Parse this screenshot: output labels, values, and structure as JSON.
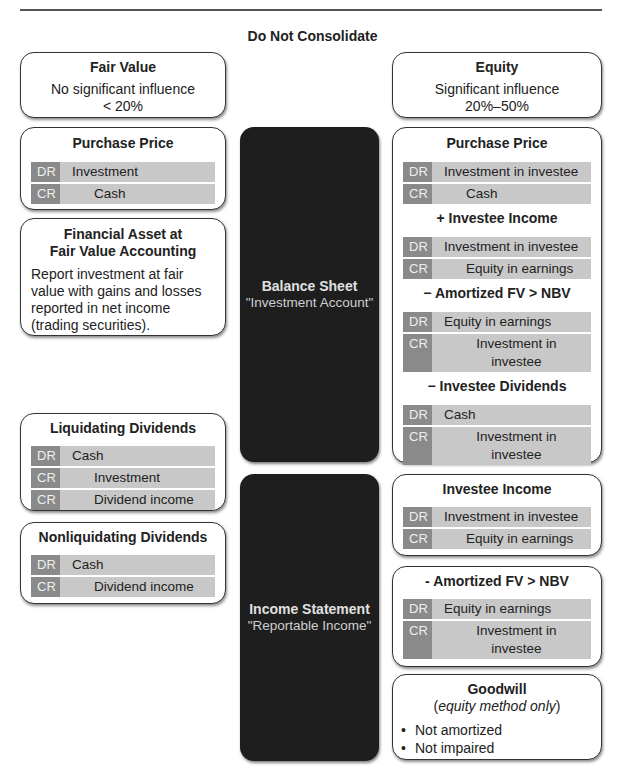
{
  "title": "Do Not Consolidate",
  "fair_value": {
    "header": {
      "title": "Fair Value",
      "line1": "No significant influence",
      "line2": "< 20%"
    },
    "purchase_price": {
      "title": "Purchase Price",
      "entries": [
        {
          "tag": "DR",
          "account": "Investment"
        },
        {
          "tag": "CR",
          "account": "Cash"
        }
      ]
    },
    "financial_asset": {
      "title_line1": "Financial Asset at",
      "title_line2": "Fair Value Accounting",
      "text": "Report investment at fair value with gains and losses reported in net income (trading securities)."
    },
    "liquidating": {
      "title": "Liquidating Dividends",
      "entries": [
        {
          "tag": "DR",
          "account": "Cash"
        },
        {
          "tag": "CR",
          "account": "Investment"
        },
        {
          "tag": "CR",
          "account": "Dividend income"
        }
      ]
    },
    "nonliquidating": {
      "title": "Nonliquidating Dividends",
      "entries": [
        {
          "tag": "DR",
          "account": "Cash"
        },
        {
          "tag": "CR",
          "account": "Dividend income"
        }
      ]
    }
  },
  "center": {
    "balance_sheet": {
      "title": "Balance Sheet",
      "subtitle": "\"Investment Account\""
    },
    "income_statement": {
      "title": "Income Statement",
      "subtitle": "\"Reportable Income\""
    }
  },
  "equity": {
    "header": {
      "title": "Equity",
      "line1": "Significant influence",
      "line2": "20%–50%"
    },
    "balance_sheet_box": {
      "purchase_price": {
        "title": "Purchase Price",
        "entries": [
          {
            "tag": "DR",
            "account": "Investment in investee"
          },
          {
            "tag": "CR",
            "account": "Cash"
          }
        ]
      },
      "investee_income": {
        "title": "+ Investee Income",
        "entries": [
          {
            "tag": "DR",
            "account": "Investment in investee"
          },
          {
            "tag": "CR",
            "account": "Equity in earnings"
          }
        ]
      },
      "amortized": {
        "title": "− Amortized FV > NBV",
        "entries": [
          {
            "tag": "DR",
            "account": "Equity in earnings"
          },
          {
            "tag": "CR",
            "account": "Investment in investee"
          }
        ]
      },
      "dividends": {
        "title": "− Investee Dividends",
        "entries": [
          {
            "tag": "DR",
            "account": "Cash"
          },
          {
            "tag": "CR",
            "account": "Investment in investee"
          }
        ]
      }
    },
    "income_investee": {
      "title": "Investee Income",
      "entries": [
        {
          "tag": "DR",
          "account": "Investment in investee"
        },
        {
          "tag": "CR",
          "account": "Equity in earnings"
        }
      ]
    },
    "income_amortized": {
      "title": "- Amortized FV > NBV",
      "entries": [
        {
          "tag": "DR",
          "account": "Equity in earnings"
        },
        {
          "tag": "CR",
          "account": "Investment in investee"
        }
      ]
    },
    "goodwill": {
      "title": "Goodwill",
      "subtitle": "equity method only",
      "bullets": [
        "Not amortized",
        "Not impaired"
      ]
    }
  }
}
